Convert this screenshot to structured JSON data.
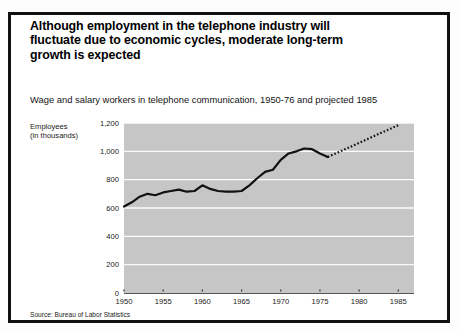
{
  "title": "Although employment in the telephone industry will fluctuate due to economic cycles, moderate long-term growth is expected",
  "subtitle": "Wage and salary workers in telephone communication, 1950-76 and projected 1985",
  "axis_caption": "Employees\n(in thousands)",
  "source": "Source: Bureau of Labor Statistics",
  "colors": {
    "plot_background": "#c6c6c6",
    "gridline": "#fbfbfb",
    "line": "#111111",
    "frame": "#111111",
    "page_background": "#ffffff"
  },
  "chart_data": {
    "type": "line",
    "title": "Wage and salary workers in telephone communication, 1950-76 and projected 1985",
    "xlabel": "",
    "ylabel": "Employees (in thousands)",
    "xlim": [
      1950,
      1987
    ],
    "ylim": [
      0,
      1200
    ],
    "grid": true,
    "legend": "none",
    "ytick_labels": [
      "0",
      "200",
      "400",
      "600",
      "800",
      "1,000",
      "1,200"
    ],
    "yticks": [
      0,
      200,
      400,
      600,
      800,
      1000,
      1200
    ],
    "xticks": [
      1950,
      1955,
      1960,
      1965,
      1970,
      1975,
      1980,
      1985
    ],
    "xtick_labels": [
      "1950",
      "1955",
      "1960",
      "1965",
      "1970",
      "1975",
      "1980",
      "1985"
    ],
    "series": [
      {
        "name": "Actual employment",
        "style": "solid",
        "x": [
          1950,
          1951,
          1952,
          1953,
          1954,
          1955,
          1956,
          1957,
          1958,
          1959,
          1960,
          1961,
          1962,
          1963,
          1964,
          1965,
          1966,
          1967,
          1968,
          1969,
          1970,
          1971,
          1972,
          1973,
          1974,
          1975,
          1976
        ],
        "values": [
          610,
          640,
          680,
          700,
          690,
          710,
          720,
          730,
          715,
          720,
          760,
          735,
          720,
          715,
          715,
          720,
          760,
          810,
          855,
          870,
          940,
          985,
          1000,
          1020,
          1015,
          985,
          960
        ]
      },
      {
        "name": "Projected employment",
        "style": "dotted",
        "x": [
          1976,
          1977,
          1978,
          1979,
          1980,
          1981,
          1982,
          1983,
          1984,
          1985
        ],
        "values": [
          960,
          985,
          1010,
          1035,
          1060,
          1085,
          1110,
          1135,
          1160,
          1185
        ]
      }
    ]
  }
}
